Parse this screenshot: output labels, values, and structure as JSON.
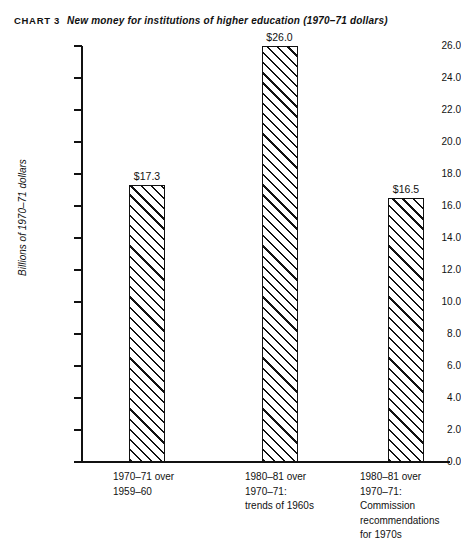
{
  "header": {
    "chart_number": "CHART 3",
    "title": "New money for institutions of higher education (1970–71 dollars)"
  },
  "chart_data": {
    "type": "bar",
    "title": "New money for institutions of higher education (1970–71 dollars)",
    "chart_label": "CHART 3",
    "xlabel": "",
    "ylabel": "Billions of 1970–71 dollars",
    "ylim": [
      0.0,
      26.0
    ],
    "grid": false,
    "legend": null,
    "categories": [
      "1970–71 over\n1959–60",
      "1980–81 over\n1970–71:\ntrends of 1960s",
      "1980–81 over\n1970–71:\nCommission\nrecommendations\nfor 1970s"
    ],
    "values": [
      17.3,
      26.0,
      16.5
    ],
    "value_labels": [
      "$17.3",
      "$26.0",
      "$16.5"
    ],
    "ytick_labels": [
      "26.0",
      "24.0",
      "22.0",
      "20.0",
      "18.0",
      "16.0",
      "14.0",
      "12.0",
      "10.0",
      "8.0",
      "6.0",
      "4.0",
      "2.0",
      "0.0"
    ],
    "ytick_values": [
      26.0,
      24.0,
      22.0,
      20.0,
      18.0,
      16.0,
      14.0,
      12.0,
      10.0,
      8.0,
      6.0,
      4.0,
      2.0,
      0.0
    ],
    "bar_fill": "diagonal-hatch",
    "colors": {
      "ink": "#111111",
      "background": "#ffffff"
    }
  }
}
